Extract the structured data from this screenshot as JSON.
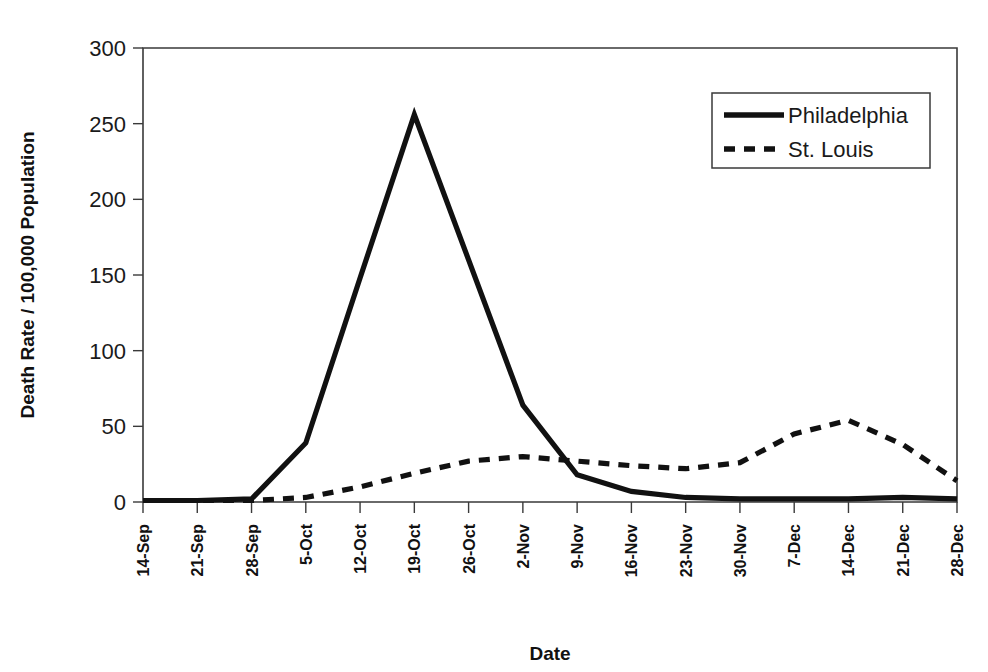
{
  "chart_data": {
    "type": "line",
    "title": "",
    "xlabel": "Date",
    "ylabel": "Death Rate / 100,000 Population",
    "categories": [
      "14-Sep",
      "21-Sep",
      "28-Sep",
      "5-Oct",
      "12-Oct",
      "19-Oct",
      "26-Oct",
      "2-Nov",
      "9-Nov",
      "16-Nov",
      "23-Nov",
      "30-Nov",
      "7-Dec",
      "14-Dec",
      "21-Dec",
      "28-Dec"
    ],
    "series": [
      {
        "name": "Philadelphia",
        "style": "solid",
        "values": [
          1,
          1,
          2,
          39,
          148,
          256,
          160,
          64,
          18,
          7,
          3,
          2,
          2,
          2,
          3,
          2
        ]
      },
      {
        "name": "St. Louis",
        "style": "dashed",
        "values": [
          1,
          1,
          1,
          3,
          10,
          19,
          27,
          30,
          27,
          24,
          22,
          26,
          45,
          54,
          38,
          14
        ]
      }
    ],
    "ylim": [
      0,
      300
    ],
    "yticks": [
      0,
      50,
      100,
      150,
      200,
      250,
      300
    ],
    "ytick_labels": [
      "0",
      "50",
      "100",
      "150",
      "200",
      "250",
      "300"
    ],
    "grid": false,
    "legend_position": "top-right",
    "legend_entries": [
      "Philadelphia",
      "St. Louis"
    ],
    "accent_color": "#111111",
    "frame_color": "#3a3a3a",
    "background_color": "#ffffff"
  },
  "layout": {
    "plot_left": 143,
    "plot_right": 957,
    "plot_top": 48,
    "plot_bottom": 502,
    "legend_x": 712,
    "legend_y": 93,
    "legend_width": 218,
    "legend_height": 75
  }
}
